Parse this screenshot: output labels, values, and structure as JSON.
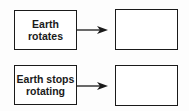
{
  "diagram": {
    "rows": [
      {
        "cause": "Earth\nrotates",
        "effect": ""
      },
      {
        "cause": "Earth stops\nrotating",
        "effect": ""
      }
    ],
    "colors": {
      "stroke": "#1a1a1a",
      "background": "#fdfdfd"
    }
  }
}
